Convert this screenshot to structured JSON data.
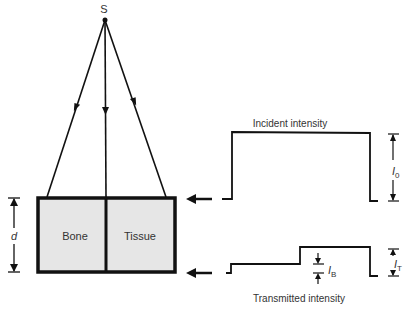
{
  "diagram": {
    "source_label": "S",
    "materials": {
      "left": "Bone",
      "right": "Tissue"
    },
    "thickness_label": "d",
    "incident": {
      "title": "Incident intensity",
      "symbol": "I",
      "subscript": "0"
    },
    "transmitted": {
      "title": "Transmitted intensity",
      "symbol_total": "I",
      "subscript_total": "T",
      "symbol_bone": "I",
      "subscript_bone": "B"
    },
    "colors": {
      "line": "#111111",
      "fill": "#e6e6e6",
      "text": "#333333"
    }
  }
}
